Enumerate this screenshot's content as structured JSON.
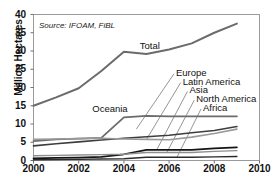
{
  "chart_data": {
    "type": "line",
    "title": "",
    "subtitle": "",
    "source_note": "Source: IFOAM, FiBL",
    "xlabel": "",
    "ylabel": "Million Hectares",
    "xlim": [
      2000,
      2010
    ],
    "ylim": [
      0,
      40
    ],
    "xticks": [
      "2000",
      "2002",
      "2004",
      "2006",
      "2008",
      "2010"
    ],
    "yticks": [
      "0",
      "5",
      "10",
      "15",
      "20",
      "25",
      "30",
      "35",
      "40"
    ],
    "grid": false,
    "legend_position": "inline-labels",
    "x": [
      2000,
      2001,
      2002,
      2003,
      2004,
      2005,
      2006,
      2007,
      2008,
      2009
    ],
    "series": [
      {
        "name": "Total",
        "color": "#6b6b6b",
        "width": 2.0,
        "values": [
          15.0,
          17.3,
          19.8,
          24.5,
          29.8,
          29.2,
          30.4,
          32.1,
          35.0,
          37.5
        ]
      },
      {
        "name": "Oceania",
        "color": "#6b6b6b",
        "width": 1.8,
        "values": [
          5.3,
          5.8,
          6.0,
          6.2,
          11.8,
          12.2,
          12.1,
          12.1,
          12.1,
          12.1
        ]
      },
      {
        "name": "Europe",
        "color": "#3d3d3d",
        "width": 1.6,
        "values": [
          4.0,
          4.6,
          5.1,
          5.6,
          6.1,
          6.5,
          6.9,
          7.6,
          8.2,
          9.3
        ]
      },
      {
        "name": "Latin America",
        "color": "#9a9a9a",
        "width": 1.6,
        "values": [
          5.8,
          5.9,
          6.0,
          6.1,
          5.9,
          5.8,
          5.7,
          6.4,
          7.4,
          8.6
        ]
      },
      {
        "name": "Asia",
        "color": "#141414",
        "width": 1.7,
        "values": [
          0.6,
          0.7,
          0.8,
          1.0,
          1.7,
          2.9,
          2.9,
          2.9,
          3.3,
          3.6
        ]
      },
      {
        "name": "North America",
        "color": "#8e8e8e",
        "width": 1.4,
        "values": [
          1.3,
          1.4,
          1.5,
          1.6,
          1.7,
          2.2,
          2.2,
          2.2,
          2.5,
          2.7
        ]
      },
      {
        "name": "Africa",
        "color": "#2b2b2b",
        "width": 1.4,
        "values": [
          0.2,
          0.25,
          0.3,
          0.4,
          0.5,
          0.9,
          0.9,
          0.9,
          1.0,
          1.1
        ]
      }
    ],
    "annotations": [
      {
        "text": "Total",
        "x": 2004.7,
        "y": 31.5
      },
      {
        "text": "Oceania",
        "x": 2002.6,
        "y": 14.0
      },
      {
        "text": "Europe",
        "x": 2006.3,
        "y": 24.0
      },
      {
        "text": "Latin America",
        "x": 2006.6,
        "y": 21.6
      },
      {
        "text": "Asia",
        "x": 2006.9,
        "y": 19.2
      },
      {
        "text": "North America",
        "x": 2007.2,
        "y": 16.8
      },
      {
        "text": "Africa",
        "x": 2007.5,
        "y": 14.4
      }
    ]
  }
}
